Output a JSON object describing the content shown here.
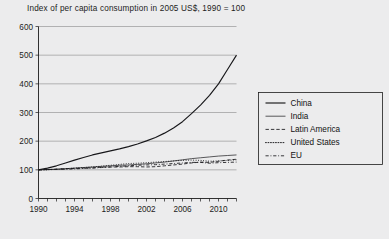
{
  "chart_data": {
    "type": "line",
    "title": "Index of per capita consumption in 2005 US$, 1990 = 100",
    "xlabel": "",
    "ylabel": "",
    "xlim": [
      1990,
      2012
    ],
    "ylim": [
      0,
      600
    ],
    "ytick_step": 100,
    "yticks": [
      0,
      100,
      200,
      300,
      400,
      500,
      600
    ],
    "xticks": [
      1990,
      1991,
      1992,
      1993,
      1994,
      1995,
      1996,
      1997,
      1998,
      1999,
      2000,
      2001,
      2002,
      2003,
      2004,
      2005,
      2006,
      2007,
      2008,
      2009,
      2010,
      2011,
      2012
    ],
    "xtick_labels": [
      1990,
      1994,
      1998,
      2002,
      2006,
      2010
    ],
    "grid": "horizontal",
    "legend_position": "right",
    "x": [
      1990,
      1991,
      1992,
      1993,
      1994,
      1995,
      1996,
      1997,
      1998,
      1999,
      2000,
      2001,
      2002,
      2003,
      2004,
      2005,
      2006,
      2007,
      2008,
      2009,
      2010,
      2011,
      2012
    ],
    "series": [
      {
        "name": "China",
        "style": "solid",
        "width": 1.15,
        "values": [
          100,
          106,
          114,
          124,
          134,
          143,
          152,
          159,
          166,
          173,
          181,
          190,
          201,
          213,
          228,
          246,
          268,
          296,
          326,
          360,
          400,
          450,
          500
        ]
      },
      {
        "name": "India",
        "style": "solid",
        "width": 0.7,
        "values": [
          100,
          101,
          102,
          104,
          106,
          108,
          110,
          112,
          114,
          116,
          117,
          119,
          121,
          124,
          127,
          131,
          135,
          139,
          142,
          145,
          148,
          150,
          152
        ]
      },
      {
        "name": "Latin America",
        "style": "dashed",
        "width": 0.85,
        "values": [
          100,
          101,
          102,
          104,
          105,
          106,
          107,
          109,
          110,
          110,
          111,
          111,
          110,
          111,
          114,
          117,
          120,
          124,
          127,
          126,
          130,
          134,
          137
        ]
      },
      {
        "name": "United States",
        "style": "dotted",
        "width": 0.95,
        "values": [
          100,
          100,
          102,
          104,
          106,
          108,
          110,
          113,
          116,
          119,
          122,
          123,
          125,
          127,
          129,
          131,
          133,
          134,
          133,
          130,
          131,
          133,
          135
        ]
      },
      {
        "name": "EU",
        "style": "dashdot",
        "width": 0.85,
        "values": [
          100,
          101,
          102,
          102,
          103,
          105,
          106,
          108,
          110,
          112,
          114,
          116,
          117,
          118,
          120,
          122,
          124,
          126,
          126,
          123,
          125,
          126,
          127
        ]
      }
    ],
    "legend_entries": [
      {
        "label": "China",
        "style": "solid",
        "width": 1.15
      },
      {
        "label": "India",
        "style": "solid",
        "width": 0.7
      },
      {
        "label": "Latin America",
        "style": "dashed",
        "width": 0.85
      },
      {
        "label": "United States",
        "style": "dotted",
        "width": 0.95
      },
      {
        "label": "EU",
        "style": "dash-dot",
        "width": 0.85
      }
    ],
    "colors": {
      "background": "#ececed",
      "line": "#17171a",
      "grid": "#8a8a8a",
      "axis": "#1c1c1c",
      "text": "#1c1c1c"
    }
  }
}
